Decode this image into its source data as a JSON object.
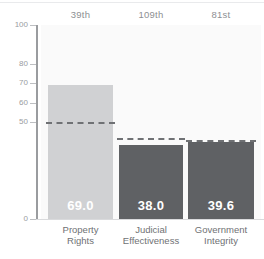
{
  "chart_data": {
    "type": "bar",
    "title": "",
    "subtitle": "",
    "xlabel": "",
    "ylabel": "",
    "ylim": [
      0,
      100
    ],
    "grid": false,
    "legend_position": "none",
    "categories": [
      "Property Rights",
      "Judicial Effectiveness",
      "Government Integrity"
    ],
    "category_lines": [
      [
        "Property",
        "Rights"
      ],
      [
        "Judicial",
        "Effectiveness"
      ],
      [
        "Government",
        "Integrity"
      ]
    ],
    "values": [
      69.0,
      38.0,
      39.6
    ],
    "value_labels": [
      "69.0",
      "38.0",
      "39.6"
    ],
    "rank_labels": [
      "39th",
      "109th",
      "81st"
    ],
    "benchmarks": [
      50.0,
      42.0,
      40.5
    ],
    "benchmark_style": "dashed",
    "ytick_values": [
      0,
      50,
      60,
      70,
      80,
      100
    ],
    "ytick_labels": [
      "0",
      "50",
      "60",
      "70",
      "80",
      "100"
    ],
    "bar_colors": [
      "#d0d1d3",
      "#5f6164",
      "#5f6164"
    ],
    "track_color": "#fafafa",
    "axis_color": "#9a9c9f",
    "benchmark_color": "#6f7174",
    "value_label_color": "#ffffff",
    "rank_label_color": "#8d8f93",
    "category_label_color": "#6f7174"
  }
}
